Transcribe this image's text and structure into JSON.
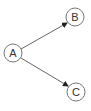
{
  "diagram": {
    "type": "directed-graph",
    "nodes": [
      {
        "id": "A",
        "label": "A",
        "cx": 13,
        "cy": 53,
        "r": 9
      },
      {
        "id": "B",
        "label": "B",
        "cx": 75,
        "cy": 17,
        "r": 9
      },
      {
        "id": "C",
        "label": "C",
        "cx": 76,
        "cy": 92,
        "r": 9
      }
    ],
    "edges": [
      {
        "from": "A",
        "to": "B"
      },
      {
        "from": "A",
        "to": "C"
      }
    ],
    "colors": {
      "node_stroke": "#777777",
      "edge_stroke": "#666666",
      "arrowhead": "#222222",
      "label": "#333333"
    }
  }
}
